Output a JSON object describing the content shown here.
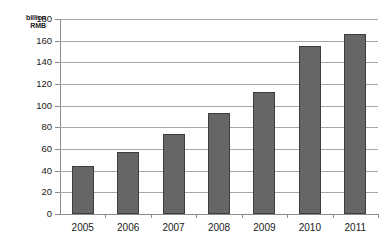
{
  "chart_data": {
    "type": "bar",
    "title": "",
    "subtitle": "",
    "xlabel": "",
    "ylabel": "billion RMB",
    "ylabel_lines": [
      "billion",
      "RMB"
    ],
    "categories": [
      "2005",
      "2006",
      "2007",
      "2008",
      "2009",
      "2010",
      "2011"
    ],
    "values": [
      44,
      57,
      74,
      93,
      113,
      155,
      166
    ],
    "series": [
      {
        "name": "billion RMB",
        "values": [
          44,
          57,
          74,
          93,
          113,
          155,
          166
        ]
      }
    ],
    "ylim": [
      0,
      180
    ],
    "ytick_step": 20,
    "yticks": [
      "180",
      "160",
      "140",
      "120",
      "100",
      "80",
      "60",
      "40",
      "20",
      "0"
    ],
    "ytick_values": [
      180,
      160,
      140,
      120,
      100,
      80,
      60,
      40,
      20,
      0
    ],
    "grid": true,
    "grid_axis": "y",
    "legend": false,
    "legend_position": "none",
    "annotations": [],
    "bar_color": "#666666",
    "bar_border_color": "#3d3d3d",
    "gridline_color": "#a6a6a6",
    "axis_color": "#8c8c8c",
    "background_color": "#ffffff",
    "text_color": "#1a1a1a"
  }
}
